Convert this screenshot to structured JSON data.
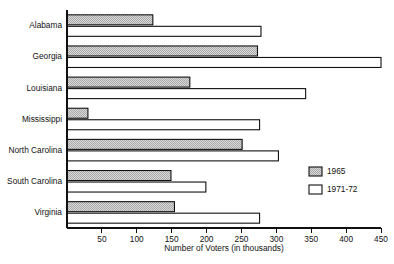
{
  "chart_data": {
    "type": "bar",
    "orientation": "horizontal",
    "title": "",
    "xlabel": "Number of Voters (in thousands)",
    "ylabel": "",
    "xlim": [
      0,
      450
    ],
    "xticks": [
      50,
      100,
      150,
      200,
      250,
      300,
      350,
      400,
      450
    ],
    "grid": false,
    "legend_position": "right",
    "categories": [
      "Alabama",
      "Georgia",
      "Louisiana",
      "Mississippi",
      "North Carolina",
      "South Carolina",
      "Virginia"
    ],
    "series": [
      {
        "name": "1965",
        "fill": "#c8c8c8",
        "pattern": "stipple",
        "values": [
          123,
          273,
          176,
          30,
          251,
          149,
          154
        ]
      },
      {
        "name": "1971-72",
        "fill": "#ffffff",
        "pattern": "solid",
        "values": [
          278,
          450,
          342,
          276,
          303,
          199,
          276
        ]
      }
    ]
  },
  "legend": {
    "items": [
      {
        "label": "1965"
      },
      {
        "label": "1971-72"
      }
    ]
  },
  "axis": {
    "x_title": "Number of Voters (in thousands)",
    "tick_labels": [
      "50",
      "100",
      "150",
      "200",
      "250",
      "300",
      "350",
      "400",
      "450"
    ]
  },
  "colors": {
    "series_1965": "#c8c8c8",
    "series_1971_72": "#ffffff",
    "outline": "#111111",
    "background": "#ffffff"
  }
}
